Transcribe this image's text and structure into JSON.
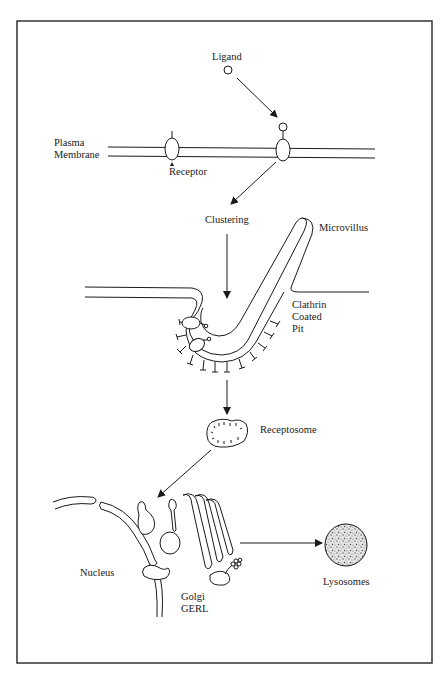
{
  "diagram": {
    "type": "biological-pathway",
    "topic": "Receptor-mediated endocytosis",
    "labels": {
      "ligand": "Ligand",
      "plasma_membrane_line1": "Plasma",
      "plasma_membrane_line2": "Membrane",
      "receptor": "Receptor",
      "clustering": "Clustering",
      "microvillus": "Microvillus",
      "clathrin_line1": "Clathrin",
      "clathrin_line2": "Coated",
      "clathrin_line3": "Pit",
      "receptosome": "Receptosome",
      "nucleus": "Nucleus",
      "golgi_line1": "Golgi",
      "golgi_line2": "GERL",
      "lysosomes": "Lysosomes"
    },
    "flow": [
      "Ligand",
      "Receptor",
      "Clustering",
      "Clathrin Coated Pit",
      "Receptosome",
      "Golgi GERL",
      "Lysosomes"
    ],
    "colors": {
      "ink": "#1a1a1a",
      "background": "#ffffff",
      "frame": "#333333"
    }
  }
}
